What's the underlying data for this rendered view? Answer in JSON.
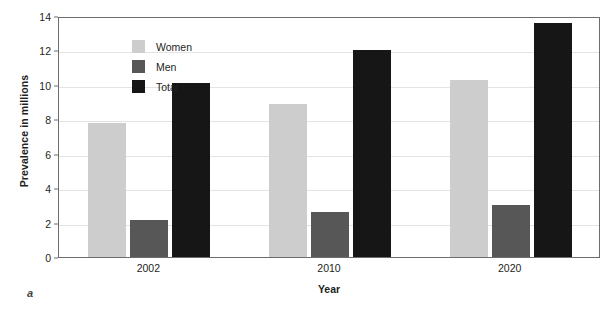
{
  "panel_label": "a",
  "legend": {
    "position": "top-left-inside",
    "items": [
      {
        "label": "Women",
        "color": "#cdcdcd",
        "key": "women"
      },
      {
        "label": "Men",
        "color": "#575757",
        "key": "men"
      },
      {
        "label": "Total",
        "color": "#161616",
        "key": "total"
      }
    ]
  },
  "chart_data": {
    "type": "bar",
    "title": "",
    "xlabel": "Year",
    "ylabel": "Prevalence in millions",
    "categories": [
      "2002",
      "2010",
      "2020"
    ],
    "series": [
      {
        "name": "Women",
        "color": "#cdcdcd",
        "values": [
          7.8,
          8.9,
          10.3
        ]
      },
      {
        "name": "Men",
        "color": "#575757",
        "values": [
          2.15,
          2.6,
          3.0
        ]
      },
      {
        "name": "Total",
        "color": "#161616",
        "values": [
          10.1,
          12.0,
          13.6
        ]
      }
    ],
    "ylim": [
      0,
      14
    ],
    "ytick_step": 2,
    "yticks": [
      "0",
      "2",
      "4",
      "6",
      "8",
      "10",
      "12",
      "14"
    ],
    "grid": true,
    "grid_axis": "y",
    "legend_position": "upper left"
  }
}
